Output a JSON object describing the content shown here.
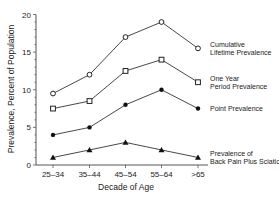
{
  "chart_data": {
    "type": "line",
    "title": "",
    "xlabel": "Decade of Age",
    "ylabel": "Prevalence, Percent of Population",
    "categories": [
      "25–34",
      "35–44",
      "45–54",
      "55–64",
      ">65"
    ],
    "ylim": [
      0,
      20
    ],
    "yticks": [
      0,
      5,
      10,
      15,
      20
    ],
    "grid": false,
    "legend_position": "inline-right",
    "series": [
      {
        "name": "Cumulative Lifetime Prevalence",
        "label_lines": [
          "Cumulative",
          "Lifetime Prevalence"
        ],
        "marker": "open-circle",
        "values": [
          9.5,
          12,
          17,
          19,
          15.5
        ]
      },
      {
        "name": "One Year Period Prevalence",
        "label_lines": [
          "One Year",
          "Period Prevalence"
        ],
        "marker": "open-square",
        "values": [
          7.5,
          8.5,
          12.5,
          14,
          11
        ]
      },
      {
        "name": "Point Prevalence",
        "label_lines": [
          "Point Prevalence"
        ],
        "marker": "filled-circle",
        "values": [
          4,
          5,
          8,
          10,
          7.5
        ]
      },
      {
        "name": "Prevalence of Back Pain Plus Sciatica",
        "label_lines": [
          "Prevalence of",
          "Back Pain Plus Sciatica"
        ],
        "marker": "filled-triangle",
        "values": [
          1,
          2,
          3,
          2,
          1
        ]
      }
    ]
  },
  "colors": {
    "line": "#333333",
    "axis": "#555555",
    "text": "#222222"
  }
}
